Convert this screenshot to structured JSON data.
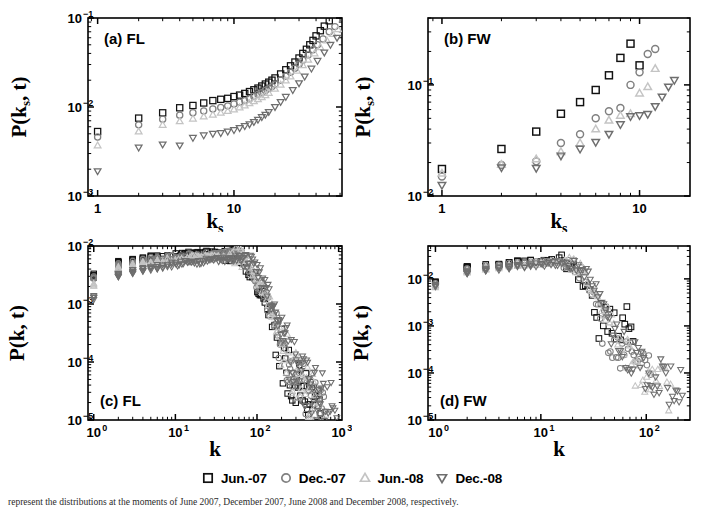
{
  "figure": {
    "panel_count": 4,
    "marker_colors": {
      "Jun.-07": "#111111",
      "Dec.-07": "#808080",
      "Jun.-08": "#c4c4c4",
      "Dec.-08": "#6e6e6e"
    },
    "caption": "represent the distributions at the moments of June 2007, December 2007, June 2008 and December 2008, respectively."
  },
  "legend": {
    "entries": [
      {
        "label": "Jun.-07",
        "marker": "square-icon",
        "color": "#111111"
      },
      {
        "label": "Dec.-07",
        "marker": "circle-icon",
        "color": "#808080"
      },
      {
        "label": "Jun.-08",
        "marker": "triangle-up-icon",
        "color": "#c4c4c4"
      },
      {
        "label": "Dec.-08",
        "marker": "triangle-down-icon",
        "color": "#6e6e6e"
      }
    ]
  },
  "chart_data": [
    {
      "id": "panel-a",
      "type": "scatter",
      "tag": "(a) FL",
      "title": "(a) FL",
      "xlabel": "k_s",
      "ylabel": "P(k_s, t)",
      "xscale": "log",
      "yscale": "log",
      "xlim": [
        0.85,
        62
      ],
      "ylim": [
        0.001,
        0.1
      ],
      "xticks": [
        1,
        10
      ],
      "xticklabels": [
        "1",
        "10"
      ],
      "yticks": [
        0.001,
        0.01,
        0.1
      ],
      "yticklabels": [
        "10-3",
        "10-2",
        "10-1"
      ],
      "grid": false,
      "legend_position": "below-figure",
      "series": [
        {
          "name": "Jun.-07",
          "marker": "square",
          "color": "#111111",
          "x": [
            1,
            2,
            3,
            4,
            5,
            6,
            7,
            8,
            9,
            10,
            11,
            12,
            13,
            14,
            15,
            16,
            17,
            18,
            19,
            20,
            22,
            24,
            26,
            28,
            30,
            32,
            34,
            36,
            38,
            40,
            43,
            46,
            50
          ],
          "y": [
            0.0053,
            0.0075,
            0.0086,
            0.0098,
            0.0104,
            0.0111,
            0.0118,
            0.0122,
            0.0125,
            0.0131,
            0.0136,
            0.0142,
            0.0149,
            0.0156,
            0.0163,
            0.0172,
            0.0181,
            0.019,
            0.02,
            0.0212,
            0.0235,
            0.0262,
            0.029,
            0.032,
            0.0355,
            0.04,
            0.0445,
            0.05,
            0.056,
            0.063,
            0.072,
            0.081,
            0.093
          ]
        },
        {
          "name": "Dec.-07",
          "marker": "circle",
          "color": "#808080",
          "x": [
            1,
            2,
            3,
            4,
            5,
            6,
            7,
            8,
            9,
            10,
            11,
            12,
            13,
            14,
            15,
            16,
            17,
            18,
            19,
            20,
            22,
            24,
            26,
            28,
            30,
            32,
            35,
            38,
            41,
            45,
            50,
            55
          ],
          "y": [
            0.0046,
            0.0063,
            0.0073,
            0.0081,
            0.0086,
            0.009,
            0.0095,
            0.0099,
            0.0103,
            0.0108,
            0.0113,
            0.0118,
            0.0124,
            0.0131,
            0.0138,
            0.0145,
            0.0153,
            0.0161,
            0.017,
            0.018,
            0.02,
            0.0222,
            0.0246,
            0.0272,
            0.0302,
            0.0335,
            0.0385,
            0.044,
            0.05,
            0.058,
            0.07,
            0.08
          ]
        },
        {
          "name": "Jun.-08",
          "marker": "triangle-up",
          "color": "#c4c4c4",
          "x": [
            1,
            2,
            3,
            4,
            5,
            6,
            7,
            8,
            9,
            10,
            11,
            12,
            13,
            14,
            15,
            16,
            17,
            18,
            20,
            22,
            24,
            26,
            29,
            32,
            35,
            39,
            43,
            48,
            53,
            58
          ],
          "y": [
            0.0037,
            0.0053,
            0.0063,
            0.0069,
            0.0074,
            0.0078,
            0.0082,
            0.0086,
            0.009,
            0.0094,
            0.0099,
            0.0104,
            0.011,
            0.0116,
            0.0122,
            0.0129,
            0.0136,
            0.0144,
            0.016,
            0.0178,
            0.0198,
            0.022,
            0.0255,
            0.0295,
            0.034,
            0.04,
            0.047,
            0.056,
            0.066,
            0.075
          ]
        },
        {
          "name": "Dec.-08",
          "marker": "triangle-down",
          "color": "#6e6e6e",
          "x": [
            1,
            2,
            3,
            4,
            5,
            6,
            7,
            8,
            9,
            10,
            11,
            12,
            13,
            14,
            15,
            16,
            17,
            18,
            20,
            22,
            24,
            27,
            30,
            33,
            37,
            41,
            46,
            51,
            57
          ],
          "y": [
            0.0019,
            0.0035,
            0.0038,
            0.0037,
            0.0045,
            0.0048,
            0.005,
            0.0051,
            0.0053,
            0.0055,
            0.0058,
            0.0061,
            0.0064,
            0.0068,
            0.0072,
            0.0077,
            0.0082,
            0.0088,
            0.01,
            0.0114,
            0.013,
            0.0155,
            0.0185,
            0.022,
            0.027,
            0.033,
            0.041,
            0.05,
            0.06
          ]
        }
      ]
    },
    {
      "id": "panel-b",
      "type": "scatter",
      "tag": "(b) FW",
      "title": "(b) FW",
      "xlabel": "k_s",
      "ylabel": "P(k_s, t)",
      "xscale": "log",
      "yscale": "log",
      "xlim": [
        0.85,
        18
      ],
      "ylim": [
        0.01,
        0.4
      ],
      "xticks": [
        1,
        10
      ],
      "xticklabels": [
        "1",
        "10"
      ],
      "yticks": [
        0.01,
        0.1
      ],
      "yticklabels": [
        "10-2",
        "10-1"
      ],
      "grid": false,
      "legend_position": "below-figure",
      "series": [
        {
          "name": "Jun.-07",
          "marker": "square",
          "color": "#111111",
          "x": [
            1,
            2,
            3,
            4,
            5,
            6,
            7,
            8,
            9,
            10
          ],
          "y": [
            0.0175,
            0.0265,
            0.038,
            0.055,
            0.07,
            0.09,
            0.122,
            0.175,
            0.235,
            0.15
          ]
        },
        {
          "name": "Dec.-07",
          "marker": "circle",
          "color": "#808080",
          "x": [
            1,
            2,
            3,
            4,
            5,
            6,
            7,
            8,
            9,
            10,
            11,
            12
          ],
          "y": [
            0.015,
            0.019,
            0.0205,
            0.03,
            0.036,
            0.05,
            0.058,
            0.062,
            0.1,
            0.13,
            0.19,
            0.21
          ]
        },
        {
          "name": "Jun.-08",
          "marker": "triangle-up",
          "color": "#c4c4c4",
          "x": [
            1,
            2,
            3,
            4,
            5,
            6,
            7,
            8,
            9,
            10,
            11,
            12
          ],
          "y": [
            0.016,
            0.0192,
            0.0215,
            0.025,
            0.03,
            0.04,
            0.048,
            0.053,
            0.055,
            0.084,
            0.096,
            0.14
          ]
        },
        {
          "name": "Dec.-08",
          "marker": "triangle-down",
          "color": "#6e6e6e",
          "x": [
            1,
            2,
            3,
            4,
            5,
            6,
            7,
            8,
            9,
            10,
            11,
            12,
            13,
            14,
            15
          ],
          "y": [
            0.0125,
            0.018,
            0.0178,
            0.023,
            0.0265,
            0.0305,
            0.036,
            0.044,
            0.052,
            0.053,
            0.0545,
            0.064,
            0.078,
            0.096,
            0.11
          ]
        }
      ]
    },
    {
      "id": "panel-c",
      "type": "scatter",
      "tag": "(c) FL",
      "title": "(c) FL",
      "xlabel": "k",
      "ylabel": "P(k, t)",
      "xscale": "log",
      "yscale": "log",
      "xlim": [
        0.85,
        1100
      ],
      "ylim": [
        1e-05,
        0.01
      ],
      "xticks": [
        1,
        10,
        100,
        1000
      ],
      "xticklabels": [
        "100",
        "101",
        "102",
        "103"
      ],
      "yticks": [
        1e-05,
        0.0001,
        0.001,
        0.01
      ],
      "yticklabels": [
        "10-5",
        "10-4",
        "10-3",
        "10-2"
      ],
      "grid": false,
      "legend_position": "below-figure",
      "description": "Broad peaked degree distribution with plateau near 5e-3 from k~4 to k~80, sharp cutoff beyond k~150, scattered tail to k~900 dropping to 1e-5",
      "series": [
        {
          "name": "Jun.-07",
          "marker": "square",
          "color": "#111111",
          "peak_y": 0.008,
          "peak_x": 40,
          "low_x": 1,
          "low_y": 0.0031,
          "cutoff_x": 160,
          "tail_x_max": 620,
          "tail_y_min": 1.2e-05,
          "n_points": 150
        },
        {
          "name": "Dec.-07",
          "marker": "circle",
          "color": "#808080",
          "peak_y": 0.0075,
          "peak_x": 45,
          "low_x": 1,
          "low_y": 0.0028,
          "cutoff_x": 170,
          "tail_x_max": 700,
          "tail_y_min": 1.3e-05,
          "n_points": 160
        },
        {
          "name": "Jun.-08",
          "marker": "triangle-up",
          "color": "#c4c4c4",
          "peak_y": 0.007,
          "peak_x": 50,
          "low_x": 1,
          "low_y": 0.0022,
          "cutoff_x": 180,
          "tail_x_max": 760,
          "tail_y_min": 1.2e-05,
          "n_points": 170
        },
        {
          "name": "Dec.-08",
          "marker": "triangle-down",
          "color": "#6e6e6e",
          "peak_y": 0.0062,
          "peak_x": 60,
          "low_x": 1,
          "low_y": 0.0013,
          "cutoff_x": 200,
          "tail_x_max": 950,
          "tail_y_min": 1.3e-05,
          "n_points": 185
        }
      ]
    },
    {
      "id": "panel-d",
      "type": "scatter",
      "tag": "(d) FW",
      "title": "(d) FW",
      "xlabel": "k",
      "ylabel": "P(k, t)",
      "xscale": "log",
      "yscale": "log",
      "xlim": [
        0.85,
        260
      ],
      "ylim": [
        1e-05,
        0.05
      ],
      "xticks": [
        1,
        10,
        100
      ],
      "xticklabels": [
        "100",
        "101",
        "102"
      ],
      "yticks": [
        1e-05,
        0.0001,
        0.001,
        0.01
      ],
      "yticklabels": [
        "10-5",
        "10-4",
        "10-3",
        "10-2"
      ],
      "grid": false,
      "legend_position": "below-figure",
      "description": "Peaked degree distribution maximum near 2.5e-2 at k~15, decaying past k~30 with scattered tail to k~200 near 4e-5",
      "series": [
        {
          "name": "Jun.-07",
          "marker": "square",
          "color": "#111111",
          "peak_y": 0.026,
          "peak_x": 15,
          "low_x": 1,
          "low_y": 0.008,
          "cutoff_x": 35,
          "tail_x_max": 75,
          "tail_y_min": 0.0011,
          "n_points": 70
        },
        {
          "name": "Dec.-07",
          "marker": "circle",
          "color": "#808080",
          "peak_y": 0.024,
          "peak_x": 16,
          "low_x": 1,
          "low_y": 0.0075,
          "cutoff_x": 38,
          "tail_x_max": 110,
          "tail_y_min": 0.0001,
          "n_points": 85
        },
        {
          "name": "Jun.-08",
          "marker": "triangle-up",
          "color": "#c4c4c4",
          "peak_y": 0.023,
          "peak_x": 17,
          "low_x": 1,
          "low_y": 0.0072,
          "cutoff_x": 42,
          "tail_x_max": 170,
          "tail_y_min": 4e-05,
          "n_points": 95
        },
        {
          "name": "Dec.-08",
          "marker": "triangle-down",
          "color": "#6e6e6e",
          "peak_y": 0.022,
          "peak_x": 18,
          "low_x": 1,
          "low_y": 0.007,
          "cutoff_x": 45,
          "tail_x_max": 220,
          "tail_y_min": 4e-05,
          "n_points": 110
        }
      ]
    }
  ]
}
